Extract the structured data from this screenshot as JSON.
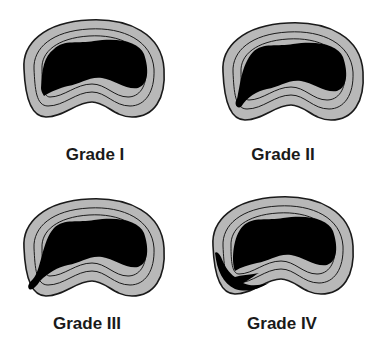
{
  "figure": {
    "panels": [
      {
        "id": "grade-1",
        "label": "Grade I",
        "tear": "inner annulus"
      },
      {
        "id": "grade-2",
        "label": "Grade II",
        "tear": "to middle annulus"
      },
      {
        "id": "grade-3",
        "label": "Grade III",
        "tear": "to outer annulus"
      },
      {
        "id": "grade-4",
        "label": "Grade IV",
        "tear": "circumferential spread in outer annulus"
      }
    ],
    "colors": {
      "annulus": "#b8b8b8",
      "nucleus": "#000000",
      "outline": "#1a1a1a",
      "background": "#ffffff"
    }
  }
}
